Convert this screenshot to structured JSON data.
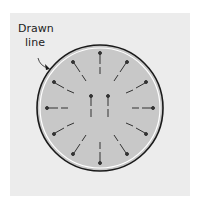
{
  "figure": {
    "label_line1": "Drawn",
    "label_line2": "line",
    "colors": {
      "background": "#ececec",
      "disc_fill": "#c8c8c8",
      "outline": "#1a1a1a",
      "inner_ring": "#ffffff",
      "pin": "#333333"
    },
    "circle": {
      "cx": 100,
      "cy": 108,
      "r": 63
    },
    "radial_pin_count": 12,
    "center_pin_count": 2
  }
}
